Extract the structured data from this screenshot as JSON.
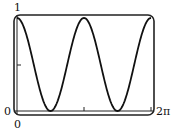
{
  "chart_data": {
    "type": "line",
    "title": "",
    "xlabel": "",
    "ylabel": "",
    "function": "cos^2(x)",
    "xlim": [
      0,
      6.2832
    ],
    "ylim": [
      0,
      1
    ],
    "grid": false,
    "legend": null,
    "x_tick_labels": [
      "0",
      "2π"
    ],
    "y_tick_labels": [
      "0",
      "1"
    ],
    "x": [
      0,
      0.7854,
      1.5708,
      2.3562,
      3.1416,
      3.927,
      4.7124,
      5.4978,
      6.2832
    ],
    "series": [
      {
        "name": "y = cos²x",
        "values": [
          1,
          0.5,
          0,
          0.5,
          1,
          0.5,
          0,
          0.5,
          1
        ]
      }
    ]
  },
  "labels": {
    "y_max": "1",
    "y_min": "0",
    "x_min": "0",
    "x_max": "2π"
  },
  "colors": {
    "curve": "#111111",
    "frame": "#222222"
  }
}
